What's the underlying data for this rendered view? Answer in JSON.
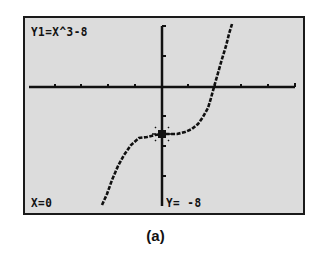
{
  "screen": {
    "equation_label": "Y1=X^3-8",
    "trace_x_label": "X=0",
    "trace_y_label": "Y= -8",
    "background_color": "#dcdcdc",
    "border_color": "#1a1a1a"
  },
  "graph": {
    "function": "x^3-8",
    "cursor": {
      "x": 0,
      "y": -8
    },
    "axes": "on",
    "x_ticks": 10,
    "y_ticks": 4
  },
  "caption": "(a)"
}
